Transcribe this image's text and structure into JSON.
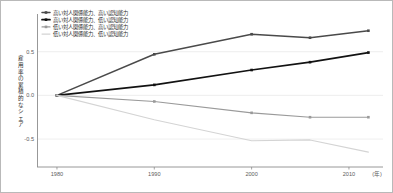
{
  "chart_data": {
    "type": "line",
    "title": "",
    "xlabel": "",
    "ylabel": "雇用率の累積的なシェア",
    "xunit": "(年)",
    "x": [
      1980,
      1990,
      2000,
      2006,
      2012
    ],
    "xtick_labels": [
      "1980",
      "1990",
      "2000",
      "2010"
    ],
    "xtick_values": [
      1980,
      1990,
      2000,
      2010
    ],
    "ytick_labels": [
      "0.5",
      "0.0",
      "-0.5"
    ],
    "ytick_values": [
      0.5,
      0.0,
      -0.5
    ],
    "xlim": [
      1978,
      2013.5
    ],
    "ylim": [
      -0.82,
      0.92
    ],
    "grid": true,
    "legend_position": "upper-left",
    "series": [
      {
        "name": "高い対人関係能力、高い認知能力",
        "color": "#4a4a4a",
        "marker": "square",
        "width": 1.5,
        "values": [
          0.0,
          0.47,
          0.7,
          0.66,
          0.74
        ]
      },
      {
        "name": "高い対人関係能力、低い認知能力",
        "color": "#121212",
        "marker": "square",
        "width": 1.7,
        "values": [
          0.0,
          0.12,
          0.29,
          0.38,
          0.49
        ]
      },
      {
        "name": "低い対人関係能力、高い認知能力",
        "color": "#9a9a9a",
        "marker": "square",
        "width": 1.1,
        "values": [
          0.0,
          -0.07,
          -0.2,
          -0.25,
          -0.25
        ]
      },
      {
        "name": "低い対人関係能力、低い認知能力",
        "color": "#d4d4d4",
        "marker": "none",
        "width": 1.1,
        "values": [
          0.0,
          -0.28,
          -0.52,
          -0.51,
          -0.65
        ]
      }
    ]
  },
  "legend": {
    "items": [
      {
        "label": "高い対人関係能力、高い認知能力",
        "color": "#4a4a4a",
        "marker": "square"
      },
      {
        "label": "高い対人関係能力、低い認知能力",
        "color": "#121212",
        "marker": "square"
      },
      {
        "label": "低い対人関係能力、高い認知能力",
        "color": "#9a9a9a",
        "marker": "square"
      },
      {
        "label": "低い対人関係能力、低い認知能力",
        "color": "#d4d4d4",
        "marker": "none"
      }
    ]
  },
  "axes": {
    "y_axis_title": "雇用率の累積的なシェア",
    "x_axis_unit": "(年)"
  }
}
